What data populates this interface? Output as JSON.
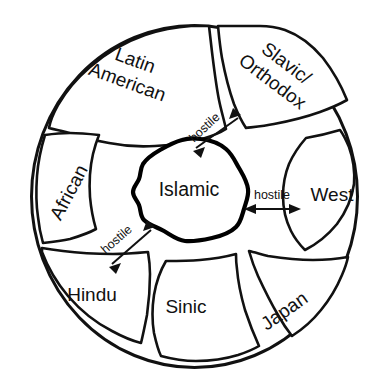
{
  "diagram": {
    "shape": "circle",
    "stroke_color": "#111111",
    "fill_color": "#ffffff",
    "core": {
      "label": "Islamic",
      "position": {
        "x": 189,
        "y": 191
      }
    },
    "regions": [
      {
        "id": "latin-american",
        "label_line1": "Latin",
        "label_line2": "American",
        "rotation_deg": 20,
        "position": {
          "x": 131,
          "y": 72
        }
      },
      {
        "id": "slavic-orthodox",
        "label_line1": "Slavic/",
        "label_line2": "Orthodox",
        "rotation_deg": 37,
        "position": {
          "x": 279,
          "y": 73
        }
      },
      {
        "id": "african",
        "label_line1": "African",
        "label_line2": "",
        "rotation_deg": -62,
        "position": {
          "x": 70,
          "y": 193
        }
      },
      {
        "id": "west",
        "label_line1": "West",
        "label_line2": "",
        "rotation_deg": 0,
        "position": {
          "x": 332,
          "y": 196
        }
      },
      {
        "id": "hindu",
        "label_line1": "Hindu",
        "label_line2": "",
        "rotation_deg": 0,
        "position": {
          "x": 92,
          "y": 296
        }
      },
      {
        "id": "sinic",
        "label_line1": "Sinic",
        "label_line2": "",
        "rotation_deg": 0,
        "position": {
          "x": 186,
          "y": 308
        }
      },
      {
        "id": "japan",
        "label_line1": "Japan",
        "label_line2": "",
        "rotation_deg": -35,
        "position": {
          "x": 285,
          "y": 312
        }
      }
    ],
    "relations": [
      {
        "id": "islamic-slavic-orthodox",
        "label": "hostile",
        "from": "islamic",
        "to": "slavic-orthodox",
        "rotation_deg": -43,
        "label_position": {
          "x": 205,
          "y": 128
        }
      },
      {
        "id": "islamic-west",
        "label": "hostile",
        "from": "islamic",
        "to": "west",
        "rotation_deg": 0,
        "label_position": {
          "x": 272,
          "y": 196
        }
      },
      {
        "id": "islamic-hindu",
        "label": "hostile",
        "from": "islamic",
        "to": "hindu",
        "rotation_deg": -41,
        "label_position": {
          "x": 117,
          "y": 240
        }
      }
    ]
  }
}
